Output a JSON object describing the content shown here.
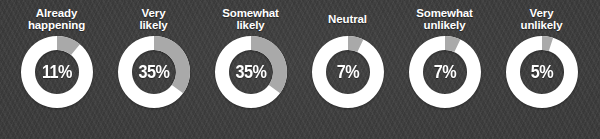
{
  "chart_data": {
    "type": "pie",
    "variant": "donut-grid",
    "title": "",
    "xlabel": "",
    "ylabel": "",
    "categories": [
      "Already happening",
      "Very likely",
      "Somewhat likely",
      "Neutral",
      "Somewhat unlikely",
      "Very unlikely"
    ],
    "values": [
      11,
      35,
      35,
      7,
      7,
      5
    ],
    "value_labels": [
      "11%",
      "35%",
      "35%",
      "7%",
      "7%",
      "5%"
    ],
    "unit": "%",
    "total": 100,
    "legend": "none",
    "grid": false
  },
  "colors": {
    "background": "#3b3b3b",
    "track": "#ffffff",
    "segment": "#a9a9a9",
    "hole": "#3b3b3b",
    "label_text": "#ffffff",
    "value_text": "#ffffff"
  },
  "donuts": [
    {
      "id": "already-happening",
      "label": "Already\nhappening",
      "label_line_1": "Already",
      "label_line_2": "happening",
      "value": 11,
      "value_label": "11%"
    },
    {
      "id": "very-likely",
      "label": "Very\nlikely",
      "label_line_1": "Very",
      "label_line_2": "likely",
      "value": 35,
      "value_label": "35%"
    },
    {
      "id": "somewhat-likely",
      "label": "Somewhat\nlikely",
      "label_line_1": "Somewhat",
      "label_line_2": "likely",
      "value": 35,
      "value_label": "35%"
    },
    {
      "id": "neutral",
      "label": "Neutral",
      "label_line_1": "Neutral",
      "label_line_2": "",
      "value": 7,
      "value_label": "7%"
    },
    {
      "id": "somewhat-unlikely",
      "label": "Somewhat\nunlikely",
      "label_line_1": "Somewhat",
      "label_line_2": "unlikely",
      "value": 7,
      "value_label": "7%"
    },
    {
      "id": "very-unlikely",
      "label": "Very\nunlikely",
      "label_line_1": "Very",
      "label_line_2": "unlikely",
      "value": 5,
      "value_label": "5%"
    }
  ]
}
